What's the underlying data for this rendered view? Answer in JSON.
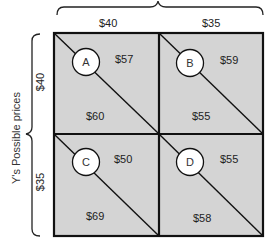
{
  "x_axis": {
    "label": "",
    "prices": [
      "$40",
      "$35"
    ]
  },
  "y_axis": {
    "label": "Y's Possible prices",
    "prices": [
      "$40",
      "$35"
    ]
  },
  "cells": [
    {
      "id": "A",
      "upper": "$57",
      "lower": "$60"
    },
    {
      "id": "B",
      "upper": "$59",
      "lower": "$55"
    },
    {
      "id": "C",
      "upper": "$50",
      "lower": "$69"
    },
    {
      "id": "D",
      "upper": "$55",
      "lower": "$58"
    }
  ],
  "colors": {
    "cell_fill": "#d4d4d4",
    "border": "#111111",
    "circle_fill": "#ffffff"
  }
}
